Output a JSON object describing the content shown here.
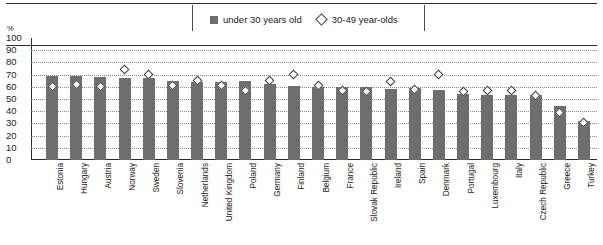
{
  "legend": {
    "items": [
      {
        "label": "under 30 years old",
        "marker": "filled-square",
        "color": "#6e6e6e"
      },
      {
        "label": "30-49 year-olds",
        "marker": "open-diamond",
        "color": "#3b3b3b"
      }
    ]
  },
  "axis": {
    "unit_label": "%",
    "ticks": [
      "100",
      "90",
      "80",
      "70",
      "60",
      "50",
      "40",
      "30",
      "20",
      "10",
      "0"
    ]
  },
  "chart_data": {
    "type": "bar",
    "title": "",
    "subtitle": "",
    "xlabel": "",
    "ylabel": "%",
    "ylim": [
      0,
      100
    ],
    "ytick_step": 10,
    "grid": true,
    "legend_position": "top-center",
    "categories": [
      "Estonia",
      "Hungary",
      "Austria",
      "Norway",
      "Sweden",
      "Slovenia",
      "Netherlands",
      "United Kingdom",
      "Poland",
      "Germany",
      "Finland",
      "Belgium",
      "France",
      "Slovak Republic",
      "Ireland",
      "Spain",
      "Denmark",
      "Portugal",
      "Luxembourg",
      "Italy",
      "Czech Republic",
      "Greece",
      "Turkey"
    ],
    "series": [
      {
        "name": "under 30 years old",
        "type": "bar",
        "color": "#6e6e6e",
        "values": [
          69,
          69,
          68,
          67,
          67,
          65,
          64,
          64,
          65,
          62,
          61,
          60,
          60,
          60,
          58,
          59,
          57,
          54,
          53,
          53,
          53,
          44,
          32
        ]
      },
      {
        "name": "30-49 year-olds",
        "type": "marker",
        "marker": "open-diamond",
        "color": "#3b3b3b",
        "values": [
          60,
          62,
          60,
          74,
          70,
          61,
          65,
          61,
          57,
          65,
          70,
          61,
          57,
          56,
          64,
          58,
          70,
          56,
          57,
          57,
          53,
          39,
          31
        ]
      }
    ]
  }
}
